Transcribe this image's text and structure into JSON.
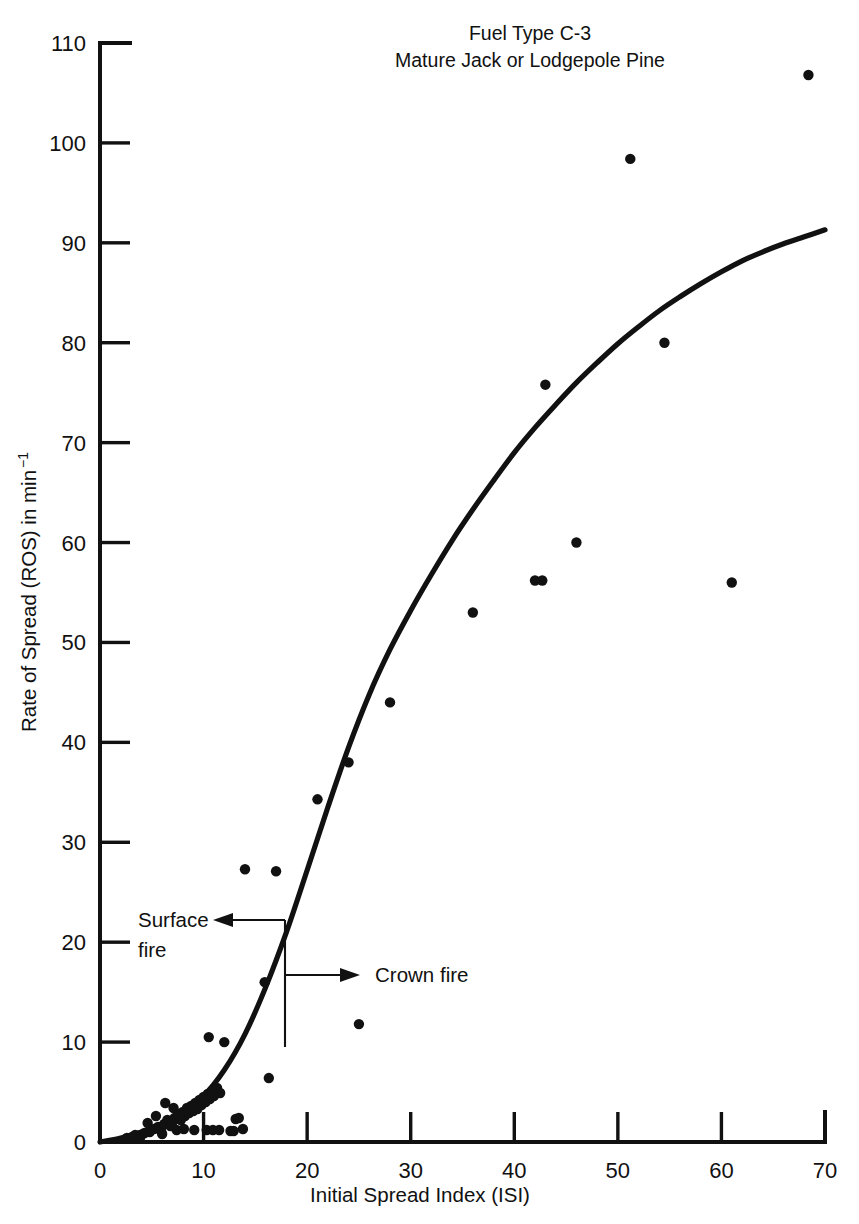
{
  "chart_data": {
    "type": "scatter",
    "title": "Fuel Type C-3",
    "subtitle": "Mature Jack or Lodgepole Pine",
    "xlabel": "Initial Spread Index (ISI)",
    "ylabel_main": "Rate of Spread (ROS) in min",
    "ylabel_exponent": "−1",
    "ylabel_full": "Rate of Spread (ROS) in min⁻¹",
    "xlim": [
      0,
      70
    ],
    "ylim": [
      0,
      110
    ],
    "xticks": [
      0,
      10,
      20,
      30,
      40,
      50,
      60,
      70
    ],
    "yticks": [
      0,
      10,
      20,
      30,
      40,
      50,
      60,
      70,
      80,
      90,
      100,
      110
    ],
    "grid": false,
    "legend": null,
    "series": [
      {
        "name": "Observed fires",
        "marker": "filled-circle",
        "color": "#111111",
        "points": [
          [
            2.6,
            0.4
          ],
          [
            3.1,
            0.5
          ],
          [
            3.4,
            0.7
          ],
          [
            3.9,
            0.5
          ],
          [
            4.3,
            0.9
          ],
          [
            4.8,
            1.0
          ],
          [
            5.2,
            1.3
          ],
          [
            5.6,
            1.5
          ],
          [
            5.9,
            1.1
          ],
          [
            6.2,
            1.8
          ],
          [
            6.5,
            2.2
          ],
          [
            6.8,
            1.6
          ],
          [
            7.0,
            2.0
          ],
          [
            7.2,
            2.4
          ],
          [
            7.4,
            1.2
          ],
          [
            7.6,
            2.8
          ],
          [
            7.8,
            2.2
          ],
          [
            8.0,
            3.0
          ],
          [
            8.2,
            2.6
          ],
          [
            8.4,
            3.4
          ],
          [
            8.6,
            2.9
          ],
          [
            8.8,
            3.6
          ],
          [
            9.0,
            3.1
          ],
          [
            9.2,
            3.9
          ],
          [
            9.4,
            3.3
          ],
          [
            9.6,
            4.2
          ],
          [
            9.8,
            3.7
          ],
          [
            10.0,
            4.5
          ],
          [
            10.2,
            4.0
          ],
          [
            10.4,
            4.8
          ],
          [
            10.6,
            4.3
          ],
          [
            10.8,
            5.1
          ],
          [
            11.0,
            4.6
          ],
          [
            11.3,
            5.4
          ],
          [
            11.6,
            4.9
          ],
          [
            6.3,
            3.9
          ],
          [
            7.1,
            3.4
          ],
          [
            5.4,
            2.6
          ],
          [
            4.6,
            1.9
          ],
          [
            6.0,
            0.8
          ],
          [
            8.1,
            1.3
          ],
          [
            9.1,
            1.2
          ],
          [
            10.3,
            1.2
          ],
          [
            10.9,
            1.2
          ],
          [
            11.5,
            1.2
          ],
          [
            12.6,
            1.1
          ],
          [
            12.9,
            1.1
          ],
          [
            13.8,
            1.3
          ],
          [
            13.1,
            2.3
          ],
          [
            13.4,
            2.4
          ],
          [
            10.5,
            10.5
          ],
          [
            12.0,
            10.0
          ],
          [
            14.0,
            27.3
          ],
          [
            17.0,
            27.1
          ],
          [
            15.9,
            16.0
          ],
          [
            16.3,
            6.4
          ],
          [
            25.0,
            11.8
          ],
          [
            21.0,
            34.3
          ],
          [
            24.0,
            38.0
          ],
          [
            28.0,
            44.0
          ],
          [
            36.0,
            53.0
          ],
          [
            42.0,
            56.2
          ],
          [
            42.7,
            56.2
          ],
          [
            46.0,
            60.0
          ],
          [
            43.0,
            75.8
          ],
          [
            54.5,
            80.0
          ],
          [
            51.2,
            98.4
          ],
          [
            61.0,
            56.0
          ],
          [
            68.4,
            106.8
          ]
        ]
      }
    ],
    "fit_curve": {
      "name": "Fitted ROS model",
      "description": "sigmoid fit through observations",
      "points": [
        [
          0,
          0
        ],
        [
          2,
          0.4
        ],
        [
          4,
          1.0
        ],
        [
          6,
          1.8
        ],
        [
          8,
          3.0
        ],
        [
          10,
          4.6
        ],
        [
          12,
          7.2
        ],
        [
          14,
          10.8
        ],
        [
          16,
          15.5
        ],
        [
          18,
          21.0
        ],
        [
          20,
          27.2
        ],
        [
          22,
          33.5
        ],
        [
          24,
          39.5
        ],
        [
          26,
          44.8
        ],
        [
          28,
          49.3
        ],
        [
          30,
          53.2
        ],
        [
          32,
          56.8
        ],
        [
          34,
          60.2
        ],
        [
          36,
          63.3
        ],
        [
          38,
          66.2
        ],
        [
          40,
          69.0
        ],
        [
          42,
          71.5
        ],
        [
          44,
          73.8
        ],
        [
          46,
          76.0
        ],
        [
          48,
          78.0
        ],
        [
          50,
          79.9
        ],
        [
          52,
          81.6
        ],
        [
          54,
          83.2
        ],
        [
          56,
          84.6
        ],
        [
          58,
          85.9
        ],
        [
          60,
          87.1
        ],
        [
          62,
          88.2
        ],
        [
          64,
          89.1
        ],
        [
          66,
          89.9
        ],
        [
          68,
          90.6
        ],
        [
          70,
          91.3
        ]
      ]
    },
    "annotations": [
      {
        "id": "surface-fire",
        "label_line1": "Surface",
        "label_line2": "fire",
        "arrow_direction": "left",
        "points_to_x": 17.8,
        "points_to_y": 20.5
      },
      {
        "id": "crown-fire",
        "label_line1": "Crown fire",
        "arrow_direction": "right",
        "points_from_x": 17.8,
        "points_from_y": 14.8
      }
    ]
  },
  "colors": {
    "ink": "#111111",
    "background": "#ffffff"
  }
}
